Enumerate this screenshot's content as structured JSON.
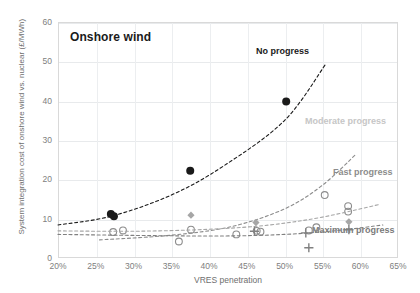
{
  "chart_data": {
    "type": "scatter",
    "title": "Onshore wind",
    "xlabel": "VRES penetration",
    "ylabel": "System integration cost of onshore wind vs. nuclear (£/MWh)",
    "xlim": [
      20,
      65
    ],
    "ylim": [
      0,
      60
    ],
    "xticks": [
      "20%",
      "25%",
      "30%",
      "35%",
      "40%",
      "45%",
      "50%",
      "55%",
      "60%",
      "65%"
    ],
    "yticks": [
      "0",
      "10",
      "20",
      "30",
      "40",
      "50",
      "60"
    ],
    "grid": true,
    "legend_position": "inline-annotations",
    "annotations": [
      {
        "text": "No progress",
        "color": "#1a1a1a"
      },
      {
        "text": "Moderate progress",
        "color": "#c6c6c6"
      },
      {
        "text": "Fast progress",
        "color": "#8c8c8c"
      },
      {
        "text": "Maximum progress",
        "color": "#7a7a7a"
      }
    ],
    "series": [
      {
        "name": "No progress",
        "marker": "filled-circle",
        "color": "#1a1a1a",
        "trend": "dashed-exponential",
        "points": [
          {
            "x": 27.0,
            "y": 11.2
          },
          {
            "x": 27.4,
            "y": 10.6
          },
          {
            "x": 37.5,
            "y": 22.2
          },
          {
            "x": 50.2,
            "y": 39.8
          }
        ],
        "trend_points": [
          {
            "x": 20.0,
            "y": 8.4
          },
          {
            "x": 27.0,
            "y": 10.6
          },
          {
            "x": 35.0,
            "y": 16.0
          },
          {
            "x": 42.0,
            "y": 23.5
          },
          {
            "x": 50.0,
            "y": 35.0
          },
          {
            "x": 55.5,
            "y": 49.5
          }
        ]
      },
      {
        "name": "Moderate progress",
        "marker": "open-circle",
        "color": "#8c8c8c",
        "trend": "dashed-exponential",
        "points": [
          {
            "x": 27.3,
            "y": 6.6
          },
          {
            "x": 28.6,
            "y": 7.0
          },
          {
            "x": 36.0,
            "y": 4.2
          },
          {
            "x": 37.6,
            "y": 7.2
          },
          {
            "x": 43.6,
            "y": 6.0
          },
          {
            "x": 46.3,
            "y": 6.9
          },
          {
            "x": 46.8,
            "y": 6.7
          },
          {
            "x": 53.2,
            "y": 7.0
          },
          {
            "x": 54.2,
            "y": 7.8
          },
          {
            "x": 55.3,
            "y": 16.0
          },
          {
            "x": 58.4,
            "y": 13.2
          },
          {
            "x": 58.4,
            "y": 11.8
          }
        ],
        "trend_points": [
          {
            "x": 25.5,
            "y": 4.6
          },
          {
            "x": 35.0,
            "y": 5.8
          },
          {
            "x": 43.0,
            "y": 8.0
          },
          {
            "x": 50.0,
            "y": 12.5
          },
          {
            "x": 55.0,
            "y": 18.5
          },
          {
            "x": 59.5,
            "y": 26.5
          }
        ]
      },
      {
        "name": "Fast progress",
        "marker": "diamond",
        "color": "#a6a6a6",
        "trend": "dashed-exponential",
        "points": [
          {
            "x": 37.6,
            "y": 10.9
          },
          {
            "x": 46.2,
            "y": 9.0
          },
          {
            "x": 58.5,
            "y": 9.2
          }
        ],
        "trend_points": [
          {
            "x": 20.0,
            "y": 6.9
          },
          {
            "x": 30.0,
            "y": 6.8
          },
          {
            "x": 40.0,
            "y": 7.3
          },
          {
            "x": 48.0,
            "y": 8.4
          },
          {
            "x": 55.0,
            "y": 10.4
          },
          {
            "x": 62.5,
            "y": 13.6
          }
        ]
      },
      {
        "name": "Maximum progress",
        "marker": "plus",
        "color": "#808080",
        "trend": "dashed-exponential",
        "points": [
          {
            "x": 46.0,
            "y": 6.8
          },
          {
            "x": 52.8,
            "y": 6.4
          },
          {
            "x": 53.2,
            "y": 2.6
          },
          {
            "x": 58.5,
            "y": 7.2
          }
        ],
        "trend_points": [
          {
            "x": 20.0,
            "y": 6.0
          },
          {
            "x": 32.0,
            "y": 5.7
          },
          {
            "x": 42.0,
            "y": 5.6
          },
          {
            "x": 50.0,
            "y": 6.0
          },
          {
            "x": 57.0,
            "y": 7.0
          },
          {
            "x": 63.0,
            "y": 8.4
          }
        ]
      }
    ]
  }
}
